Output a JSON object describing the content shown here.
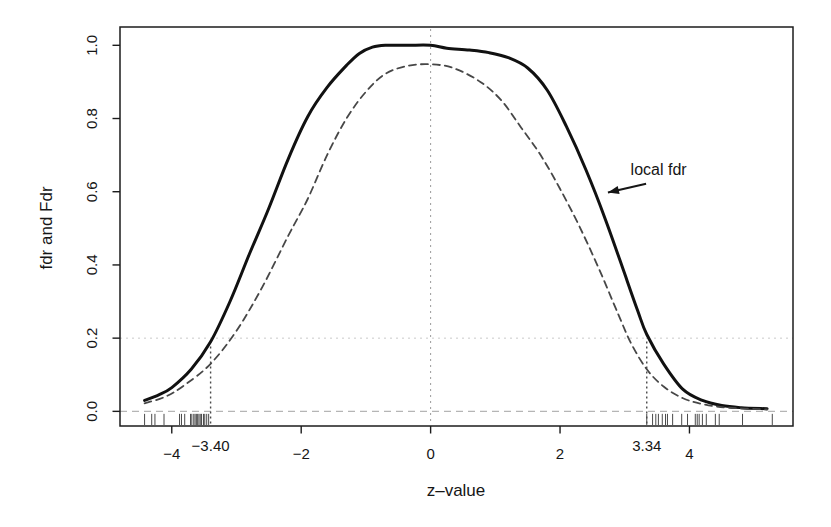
{
  "figure": {
    "background": "#ffffff",
    "box_color": "#1c1c1c"
  },
  "chart_data": {
    "type": "line",
    "title": "",
    "xlabel": "z–value",
    "ylabel": "fdr and Fdr",
    "xlim": [
      -4.8,
      5.6
    ],
    "ylim": [
      -0.04,
      1.05
    ],
    "grid": "off",
    "legend": "none (annotated with arrow)",
    "x_ticks": [
      {
        "value": -4,
        "label": "−4"
      },
      {
        "value": -2,
        "label": "−2"
      },
      {
        "value": 0,
        "label": "0"
      },
      {
        "value": 2,
        "label": "2"
      },
      {
        "value": 4,
        "label": "4"
      }
    ],
    "y_ticks": [
      {
        "value": 0.0,
        "label": "0.0"
      },
      {
        "value": 0.2,
        "label": "0.2"
      },
      {
        "value": 0.4,
        "label": "0.4"
      },
      {
        "value": 0.6,
        "label": "0.6"
      },
      {
        "value": 0.8,
        "label": "0.8"
      },
      {
        "value": 1.0,
        "label": "1.0"
      }
    ],
    "series": [
      {
        "name": "local fdr",
        "style": "solid",
        "color": "#111111",
        "width": 3,
        "dash": "",
        "points": [
          [
            -4.42,
            0.03
          ],
          [
            -4.2,
            0.045
          ],
          [
            -4.0,
            0.065
          ],
          [
            -3.7,
            0.115
          ],
          [
            -3.4,
            0.19
          ],
          [
            -3.1,
            0.3
          ],
          [
            -2.8,
            0.43
          ],
          [
            -2.5,
            0.555
          ],
          [
            -2.2,
            0.69
          ],
          [
            -1.9,
            0.805
          ],
          [
            -1.6,
            0.885
          ],
          [
            -1.3,
            0.945
          ],
          [
            -1.1,
            0.978
          ],
          [
            -0.9,
            0.995
          ],
          [
            -0.7,
            1.0
          ],
          [
            -0.35,
            1.0
          ],
          [
            0.0,
            1.0
          ],
          [
            0.25,
            0.992
          ],
          [
            0.6,
            0.987
          ],
          [
            0.9,
            0.98
          ],
          [
            1.2,
            0.966
          ],
          [
            1.5,
            0.938
          ],
          [
            1.8,
            0.878
          ],
          [
            2.1,
            0.778
          ],
          [
            2.4,
            0.66
          ],
          [
            2.7,
            0.525
          ],
          [
            3.0,
            0.375
          ],
          [
            3.2,
            0.275
          ],
          [
            3.34,
            0.21
          ],
          [
            3.6,
            0.13
          ],
          [
            3.9,
            0.06
          ],
          [
            4.2,
            0.03
          ],
          [
            4.5,
            0.016
          ],
          [
            4.8,
            0.01
          ],
          [
            5.2,
            0.007
          ]
        ]
      },
      {
        "name": "Fdr",
        "style": "dashed",
        "color": "#474747",
        "width": 1.8,
        "dash": "7 5",
        "points": [
          [
            -4.42,
            0.022
          ],
          [
            -4.1,
            0.04
          ],
          [
            -3.8,
            0.072
          ],
          [
            -3.4,
            0.13
          ],
          [
            -3.0,
            0.22
          ],
          [
            -2.6,
            0.34
          ],
          [
            -2.2,
            0.48
          ],
          [
            -1.9,
            0.58
          ],
          [
            -1.6,
            0.7
          ],
          [
            -1.3,
            0.8
          ],
          [
            -1.0,
            0.873
          ],
          [
            -0.7,
            0.922
          ],
          [
            -0.35,
            0.944
          ],
          [
            0.0,
            0.948
          ],
          [
            0.35,
            0.938
          ],
          [
            0.77,
            0.9
          ],
          [
            1.1,
            0.848
          ],
          [
            1.4,
            0.775
          ],
          [
            1.7,
            0.7
          ],
          [
            2.0,
            0.608
          ],
          [
            2.3,
            0.505
          ],
          [
            2.6,
            0.39
          ],
          [
            2.9,
            0.265
          ],
          [
            3.1,
            0.185
          ],
          [
            3.34,
            0.115
          ],
          [
            3.6,
            0.068
          ],
          [
            3.9,
            0.036
          ],
          [
            4.2,
            0.02
          ],
          [
            4.6,
            0.01
          ],
          [
            5.2,
            0.005
          ]
        ]
      }
    ],
    "reference_lines": {
      "h_dotted": {
        "y": 0.2,
        "color": "#c9c9c9",
        "dash": "2 4",
        "width": 1
      },
      "h_dashed": {
        "y": 0.0,
        "color": "#b5b5b5",
        "dash": "7 5",
        "width": 1.2
      },
      "v_center": {
        "x": 0,
        "color": "#9a9a9a",
        "dash": "2 4",
        "width": 1
      }
    },
    "thresholds": [
      {
        "z": -3.4,
        "label": "−3.40",
        "top": 0.185,
        "color": "#4a4a4a"
      },
      {
        "z": 3.34,
        "label": "3.34",
        "top": 0.2,
        "color": "#4a4a4a"
      }
    ],
    "annotation": {
      "label": "local fdr",
      "text_pos": [
        3.09,
        0.645
      ],
      "arrow_from": [
        3.33,
        0.622
      ],
      "arrow_to": [
        2.74,
        0.598
      ],
      "color": "#161616"
    },
    "rug": {
      "color": "#4a4a4a",
      "left": [
        -4.42,
        -4.31,
        -4.26,
        -4.12,
        -3.88,
        -3.85,
        -3.8,
        -3.71,
        -3.69,
        -3.66,
        -3.64,
        -3.62,
        -3.6,
        -3.58,
        -3.56,
        -3.54,
        -3.51,
        -3.49,
        -3.46,
        -3.43
      ],
      "right": [
        3.34,
        3.43,
        3.48,
        3.52,
        3.58,
        3.63,
        3.66,
        3.74,
        3.88,
        3.97,
        4.09,
        4.12,
        4.15,
        4.2,
        4.26,
        4.4,
        4.46,
        4.82,
        5.28
      ]
    }
  }
}
